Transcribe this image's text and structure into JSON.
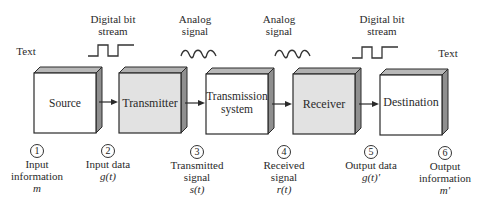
{
  "diagram": {
    "type": "block-diagram",
    "colors": {
      "shaded_box": "#e2e2e2",
      "plain_box": "#ffffff",
      "box_side": "#8f8f8f",
      "box_top": "#b8b8b8",
      "stroke": "#2a2a2a"
    },
    "top_labels": {
      "text_left": "Text",
      "digital_1_line1": "Digital bit",
      "digital_1_line2": "stream",
      "analog_1_line1": "Analog",
      "analog_1_line2": "signal",
      "analog_2_line1": "Analog",
      "analog_2_line2": "signal",
      "digital_2_line1": "Digital bit",
      "digital_2_line2": "stream",
      "text_right": "Text"
    },
    "signals": [
      {
        "kind": "digital-pulse-icon",
        "between": [
          "Source",
          "Transmitter"
        ]
      },
      {
        "kind": "analog-wave-icon",
        "between": [
          "Transmitter",
          "Transmission system"
        ]
      },
      {
        "kind": "analog-wave-icon",
        "between": [
          "Transmission system",
          "Receiver"
        ]
      },
      {
        "kind": "digital-pulse-icon",
        "between": [
          "Receiver",
          "Destination"
        ]
      }
    ],
    "blocks": [
      {
        "label_line1": "Source",
        "label_line2": "",
        "shaded": false
      },
      {
        "label_line1": "Transmitter",
        "label_line2": "",
        "shaded": true
      },
      {
        "label_line1": "Transmission",
        "label_line2": "system",
        "shaded": false
      },
      {
        "label_line1": "Receiver",
        "label_line2": "",
        "shaded": true
      },
      {
        "label_line1": "Destination",
        "label_line2": "",
        "shaded": false
      }
    ],
    "points": [
      {
        "num": "1",
        "line1": "Input",
        "line2": "information",
        "symbol": "m"
      },
      {
        "num": "2",
        "line1": "Input data",
        "line2": "",
        "symbol": "g(t)"
      },
      {
        "num": "3",
        "line1": "Transmitted",
        "line2": "signal",
        "symbol": "s(t)"
      },
      {
        "num": "4",
        "line1": "Received",
        "line2": "signal",
        "symbol": "r(t)"
      },
      {
        "num": "5",
        "line1": "Output data",
        "line2": "",
        "symbol": "g(t)'"
      },
      {
        "num": "6",
        "line1": "Output",
        "line2": "information",
        "symbol": "m'"
      }
    ]
  }
}
